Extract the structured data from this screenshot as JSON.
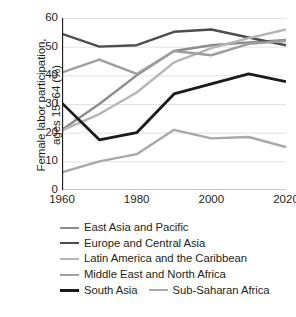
{
  "chart_data": {
    "type": "line",
    "title": "",
    "xlabel": "",
    "ylabel": "Female labor participation,\nages 15–64 (%)",
    "x": [
      1960,
      1970,
      1980,
      1990,
      2000,
      2010,
      2020
    ],
    "xlim": [
      1960,
      2020
    ],
    "ylim": [
      0,
      60
    ],
    "xticks": [
      1960,
      1980,
      2000,
      2020
    ],
    "yticks": [
      0,
      10,
      20,
      30,
      40,
      50,
      60
    ],
    "grid": "horizontal",
    "legend_position": "below",
    "series": [
      {
        "name": "East Asia and Pacific",
        "color": "#8c8c8c",
        "width": 2.4,
        "values": [
          21.0,
          30.0,
          40.0,
          48.5,
          50.5,
          51.5,
          52.3
        ]
      },
      {
        "name": "Europe and Central Asia",
        "color": "#4d4d4d",
        "width": 2.4,
        "values": [
          54.5,
          50.0,
          50.5,
          55.2,
          56.0,
          53.2,
          50.5
        ]
      },
      {
        "name": "Latin America and the Caribbean",
        "color": "#b5b5b5",
        "width": 2.4,
        "values": [
          20.8,
          26.5,
          34.0,
          44.5,
          49.5,
          53.0,
          56.0
        ]
      },
      {
        "name": "Middle East and North Africa",
        "color": "#9e9e9e",
        "width": 2.4,
        "values": [
          41.0,
          45.5,
          40.5,
          48.5,
          47.0,
          51.0,
          52.0
        ]
      },
      {
        "name": "South Asia",
        "color": "#1a1a1a",
        "width": 2.8,
        "values": [
          30.3,
          17.5,
          20.0,
          33.5,
          37.0,
          40.5,
          37.8
        ]
      },
      {
        "name": "Sub-Saharan Africa",
        "color": "#a8a8a8",
        "width": 2.4,
        "values": [
          6.2,
          10.0,
          12.5,
          21.0,
          18.0,
          18.5,
          15.0
        ]
      }
    ]
  },
  "axis": {
    "y_tick_labels": [
      "60",
      "50",
      "40",
      "30",
      "20",
      "10",
      "0"
    ],
    "x_tick_labels": [
      "1960",
      "1980",
      "2000",
      "2020"
    ],
    "y_title_line1": "Female labor participation,",
    "y_title_line2": "ages 15−64 (%)"
  },
  "legend": {
    "rows": [
      {
        "entries": [
          {
            "series": 0,
            "label": "East Asia and Pacific"
          }
        ]
      },
      {
        "entries": [
          {
            "series": 1,
            "label": "Europe and Central Asia"
          }
        ]
      },
      {
        "entries": [
          {
            "series": 2,
            "label": "Latin America and the Caribbean"
          }
        ]
      },
      {
        "entries": [
          {
            "series": 3,
            "label": "Middle East and North Africa"
          }
        ]
      },
      {
        "entries": [
          {
            "series": 4,
            "label": "South Asia"
          },
          {
            "series": 5,
            "label": "Sub-Saharan Africa"
          }
        ]
      }
    ]
  },
  "colors": {
    "axis": "#231f20",
    "grid": "#e2e2e2",
    "text": "#231f20",
    "background": "#ffffff"
  }
}
